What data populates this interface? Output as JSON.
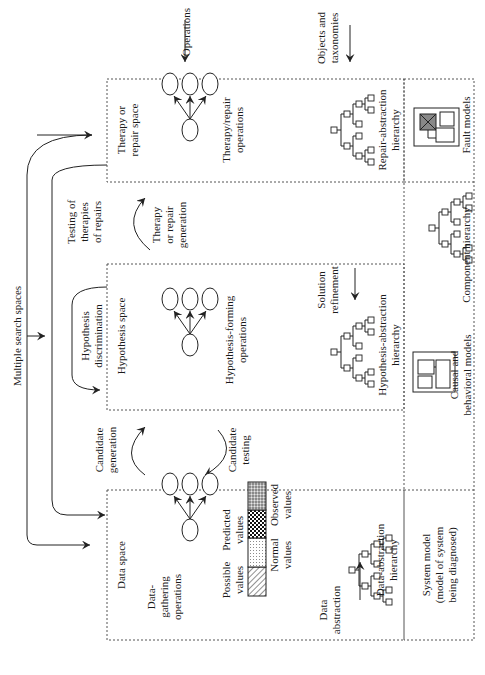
{
  "figure": {
    "orientation": "rotated 90 degrees clockwise",
    "header": {
      "multiple_search_spaces": "Multiple search spaces",
      "operations": "Operations",
      "objects_and_taxonomies_line1": "Objects and",
      "objects_and_taxonomies_line2": "taxonomies"
    },
    "spaces": [
      {
        "id": "data",
        "title": "Data space",
        "operations_label_lines": [
          "Data-",
          "gathering",
          "operations"
        ],
        "hierarchy_label_lines": [
          "Data-abstraction",
          "hierarchy"
        ]
      },
      {
        "id": "hypothesis",
        "title": "Hypothesis space",
        "operations_label_lines": [
          "Hypothesis-forming",
          "operations"
        ],
        "hierarchy_label_lines": [
          "Hypothesis-abstraction",
          "hierarchy"
        ]
      },
      {
        "id": "therapy",
        "title_lines": [
          "Therapy or",
          "repair space"
        ],
        "operations_label_lines": [
          "Therapy/repair",
          "operations"
        ],
        "hierarchy_label_lines": [
          "Repair-abstraction",
          "hierarchy"
        ]
      }
    ],
    "transitions": {
      "candidate_generation": [
        "Candidate",
        "generation"
      ],
      "candidate_testing": [
        "Candidate",
        "testing"
      ],
      "hypothesis_discrimination": [
        "Hypothesis",
        "discrimination"
      ],
      "therapy_generation": [
        "Therapy",
        "or repair",
        "generation"
      ],
      "testing_of_therapies": [
        "Testing of",
        "therapies",
        "of repairs"
      ],
      "data_abstraction": [
        "Data",
        "abstraction"
      ],
      "solution_refinement": [
        "Solution",
        "refinement"
      ]
    },
    "value_bar": {
      "top_labels": [
        [
          "Possible",
          "values"
        ],
        [
          "Predicted",
          "values"
        ]
      ],
      "bottom_labels": [
        [
          "Normal",
          "values"
        ],
        [
          "Observed",
          "values"
        ]
      ],
      "segments": [
        "hatched",
        "dotted",
        "checkered",
        "stippled"
      ]
    },
    "system_model": {
      "title_lines": [
        "System model",
        "(model of system",
        "being diagnosed)"
      ],
      "causal_label_lines": [
        "Causal and",
        "behavioral models"
      ],
      "component_label": "Component hierarchy",
      "fault_label": "Fault models"
    },
    "colors": {
      "line": "#222222",
      "dashed_border": "#555555",
      "fault_fill": "#888888"
    }
  }
}
